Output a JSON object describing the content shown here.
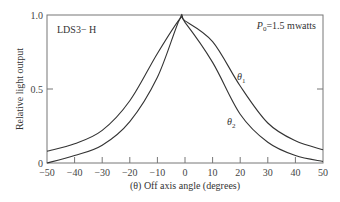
{
  "chart_data": {
    "type": "line",
    "title": "",
    "xlabel": "(θ) Off axis angle (degrees)",
    "ylabel": "Relative light output",
    "xlim": [
      -50,
      50
    ],
    "ylim": [
      0,
      1.0
    ],
    "x_ticks": [
      -50,
      -40,
      -30,
      -20,
      -10,
      0,
      10,
      20,
      30,
      40,
      50
    ],
    "x_tick_labels": [
      "−50",
      "−40",
      "−30",
      "−20",
      "−10",
      "0",
      "10",
      "20",
      "30",
      "40",
      "50"
    ],
    "y_ticks": [
      0,
      0.5,
      1.0
    ],
    "y_tick_labels": [
      "0",
      "0.5",
      "1.0"
    ],
    "grid": false,
    "legend": "inline labels on curves",
    "annotations": [
      "LDS3− H",
      "P0=1.5 mwatts"
    ],
    "x": [
      -50,
      -40,
      -30,
      -20,
      -10,
      -2,
      0,
      10,
      20,
      30,
      40,
      50
    ],
    "series": [
      {
        "name": "θ1",
        "values": [
          0.08,
          0.13,
          0.22,
          0.42,
          0.74,
          0.97,
          0.96,
          0.82,
          0.52,
          0.27,
          0.15,
          0.09
        ]
      },
      {
        "name": "θ2",
        "values": [
          0.0,
          0.05,
          0.12,
          0.28,
          0.58,
          0.97,
          0.95,
          0.68,
          0.33,
          0.14,
          0.05,
          0.01
        ]
      }
    ]
  },
  "labels": {
    "device": "LDS3− H",
    "power_prefix": "P",
    "power_sub": "0",
    "power_suffix": "=1.5 mwatts",
    "theta1_main": "θ",
    "theta1_sub": "1",
    "theta2_main": "θ",
    "theta2_sub": "2",
    "xlabel": "(θ) Off axis angle (degrees)",
    "ylabel": "Relative light output",
    "y_tick_0": "0",
    "y_tick_05": "0.5",
    "y_tick_1": "1.0"
  }
}
